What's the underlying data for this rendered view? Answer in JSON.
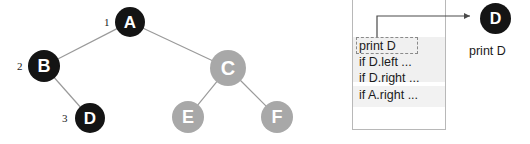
{
  "canvas": {
    "width": 530,
    "height": 144,
    "background": "#ffffff"
  },
  "colors": {
    "node_dark": "#141414",
    "node_gray": "#a8a8a8",
    "node_text": "#ffffff",
    "edge": "#9a9a9a",
    "panel_border": "#b8b8b8",
    "frame_fill": "#f0f0f0",
    "dashed_border": "#8a8a8a",
    "arrow": "#4a4a4a",
    "text": "#1b1b1b"
  },
  "tree": {
    "name": "binary-tree-diagram",
    "nodes": [
      {
        "id": "A",
        "label": "A",
        "x": 130,
        "y": 22,
        "r": 15,
        "fill": "#141414",
        "visit_order": "1"
      },
      {
        "id": "B",
        "label": "B",
        "x": 44,
        "y": 66,
        "r": 16,
        "fill": "#141414",
        "visit_order": "2"
      },
      {
        "id": "C",
        "label": "C",
        "x": 228,
        "y": 68,
        "r": 18,
        "fill": "#a8a8a8",
        "visit_order": ""
      },
      {
        "id": "D",
        "label": "D",
        "x": 90,
        "y": 118,
        "r": 15,
        "fill": "#141414",
        "visit_order": "3"
      },
      {
        "id": "E",
        "label": "E",
        "x": 188,
        "y": 117,
        "r": 16,
        "fill": "#a8a8a8",
        "visit_order": ""
      },
      {
        "id": "F",
        "label": "F",
        "x": 277,
        "y": 117,
        "r": 16,
        "fill": "#a8a8a8",
        "visit_order": ""
      }
    ],
    "edges": [
      {
        "from": "A",
        "to": "B"
      },
      {
        "from": "A",
        "to": "C"
      },
      {
        "from": "B",
        "to": "D"
      },
      {
        "from": "C",
        "to": "E"
      },
      {
        "from": "C",
        "to": "F"
      }
    ],
    "visit_markers": [
      {
        "text": "1",
        "x": 104,
        "y": 16
      },
      {
        "text": "2",
        "x": 17,
        "y": 60
      },
      {
        "text": "3",
        "x": 62,
        "y": 112
      }
    ]
  },
  "stack": {
    "name": "call-stack-panel",
    "title": "",
    "frames": [
      {
        "name": "frame-D",
        "lines": [
          {
            "text": "print D",
            "highlighted": true
          },
          {
            "text": "if D.left ...",
            "highlighted": false
          },
          {
            "text": "if D.right ...",
            "highlighted": false
          }
        ]
      },
      {
        "name": "frame-A",
        "lines": [
          {
            "text": "if A.right ...",
            "highlighted": false
          }
        ]
      }
    ]
  },
  "output": {
    "name": "output-area",
    "node_label": "D",
    "caption": "print D"
  }
}
